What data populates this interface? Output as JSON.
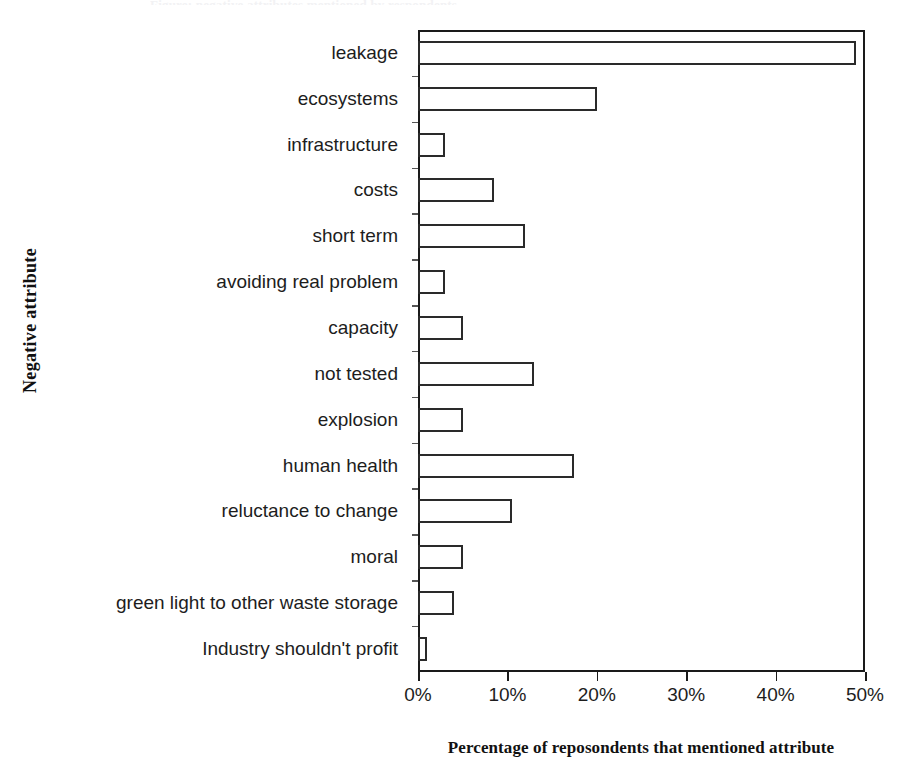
{
  "figure": {
    "caption_remnant": "Figure: negative attributes mentioned by respondents"
  },
  "chart_data": {
    "type": "bar",
    "orientation": "horizontal",
    "title": "",
    "xlabel": "Percentage of reposondents that mentioned attribute",
    "ylabel": "Negative attribute",
    "xlim": [
      0,
      50
    ],
    "xticks": [
      0,
      10,
      20,
      30,
      40,
      50
    ],
    "xticklabels": [
      "0%",
      "10%",
      "20%",
      "30%",
      "40%",
      "50%"
    ],
    "grid": false,
    "legend": null,
    "categories": [
      "leakage",
      "ecosystems",
      "infrastructure",
      "costs",
      "short term",
      "avoiding real problem",
      "capacity",
      "not tested",
      "explosion",
      "human health",
      "reluctance to change",
      "moral",
      "green light to other waste storage",
      "Industry shouldn't profit"
    ],
    "values": [
      49,
      20,
      3,
      8.5,
      12,
      3,
      5,
      13,
      5,
      17.5,
      10.5,
      5,
      4,
      1
    ]
  }
}
